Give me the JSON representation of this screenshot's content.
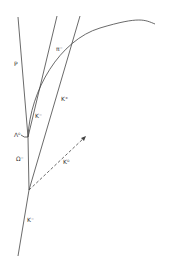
{
  "diagram": {
    "type": "bubble-chamber-event",
    "stroke_color": "#444444",
    "background": "#ffffff",
    "tracks": [
      {
        "id": "K-beam",
        "label": "K⁻"
      },
      {
        "id": "K0",
        "label": "K⁰",
        "style": "dashed"
      },
      {
        "id": "K+",
        "label": "K⁺"
      },
      {
        "id": "Omega-",
        "label": "Ω⁻"
      },
      {
        "id": "Lambda0",
        "label": "Λ⁰"
      },
      {
        "id": "P",
        "label": "P"
      },
      {
        "id": "K-secondary",
        "label": "K⁻"
      },
      {
        "id": "pi-",
        "label": "π⁻"
      }
    ]
  },
  "labels": {
    "p": "P",
    "pi_minus": "π⁻",
    "k_minus_upper": "K⁻",
    "k_plus": "K⁺",
    "lambda0": "Λ⁰",
    "omega_minus": "Ω⁻",
    "k0": "K⁰",
    "k_minus_beam": "K⁻"
  }
}
